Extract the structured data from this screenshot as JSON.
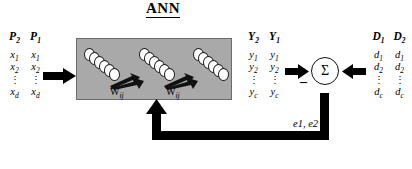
{
  "title": "ANN",
  "inputs": {
    "name": "input-pattern-columns",
    "headers": [
      "P2",
      "P1"
    ],
    "rows": [
      [
        "x1",
        "x1"
      ],
      [
        "x2",
        "x2"
      ],
      [
        "⋮",
        "⋮"
      ],
      [
        "xd",
        "xd"
      ]
    ]
  },
  "outputs": {
    "name": "network-output-columns",
    "headers": [
      "Y2",
      "Y1"
    ],
    "rows": [
      [
        "y1",
        "y1"
      ],
      [
        "y2",
        "y2"
      ],
      [
        "⋮",
        "⋮"
      ],
      [
        "yc",
        "yc"
      ]
    ]
  },
  "desired": {
    "name": "desired-output-columns",
    "headers": [
      "D1",
      "D2"
    ],
    "rows": [
      [
        "d1",
        "d1"
      ],
      [
        "d2",
        "d2"
      ],
      [
        "⋮",
        "⋮"
      ],
      [
        "dc",
        "dc"
      ]
    ]
  },
  "network": {
    "weight_label_left": "W",
    "weight_label_left_sub": "ij",
    "weight_label_right": "W",
    "weight_label_right_sub": "ij",
    "layer_count": 3,
    "neurons_per_layer": 6,
    "box_color": "#a9a9a9"
  },
  "summation": {
    "symbol": "Σ",
    "minus": "–",
    "error_label": "e1,  e2"
  },
  "colors": {
    "ink": "#000000",
    "box_fill": "#a9a9a9",
    "box_stroke": "#6b6b6b",
    "neuron_fill": "#ffffff"
  }
}
